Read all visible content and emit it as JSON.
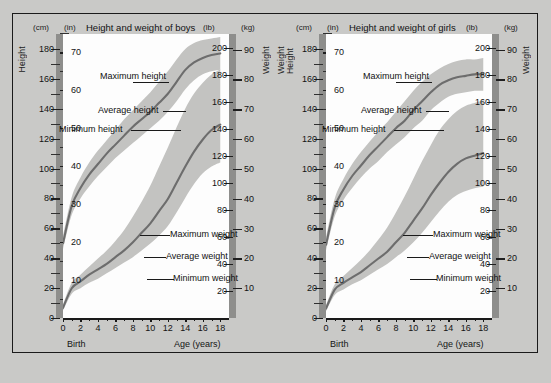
{
  "figure": {
    "background_color": "#c9c9c7",
    "plot_background_color": "#fdfdfd",
    "band_color": "#c3c3c1",
    "curve_color": "#6d6d6d",
    "scalebar_color": "#8e8e8c"
  },
  "panels": [
    {
      "id": "boys",
      "title": "Height and weight of boys",
      "left_outer_caption": "Height",
      "right_outer_caption": "Weight",
      "axes": {
        "left_outer": {
          "unit": "(cm)",
          "labels": [
            "180",
            "160",
            "140",
            "120",
            "100",
            "80",
            "60",
            "40",
            "20",
            "0"
          ]
        },
        "left_inner": {
          "unit": "(in)",
          "labels": [
            "70",
            "60",
            "50",
            "40",
            "30",
            "20",
            "10"
          ]
        },
        "right_inner": {
          "unit": "(lb)",
          "labels": [
            "200",
            "180",
            "160",
            "140",
            "120",
            "100",
            "80",
            "60",
            "40",
            "20"
          ]
        },
        "right_outer": {
          "unit": "(kg)",
          "labels": [
            "90",
            "80",
            "70",
            "60",
            "50",
            "40",
            "30",
            "20",
            "10"
          ]
        },
        "x": {
          "name": "Age (years)",
          "origin_label": "Birth",
          "labels": [
            "0",
            "2",
            "4",
            "6",
            "8",
            "10",
            "12",
            "14",
            "16",
            "18"
          ]
        }
      },
      "callouts": {
        "max_height": "Maximum\nheight",
        "avg_height": "Average height",
        "min_height": "Minimum height",
        "max_weight": "Maximum\nweight",
        "avg_weight": "Average\nweight",
        "min_weight": "Minimum\nweight"
      }
    },
    {
      "id": "girls",
      "title": "Height and weight of girls",
      "left_outer_caption": "Weight\nHeight",
      "right_outer_caption": "Weight",
      "axes": {
        "left_outer": {
          "unit": "(cm)",
          "labels": [
            "180",
            "160",
            "140",
            "120",
            "100",
            "80",
            "60",
            "40",
            "20",
            "0"
          ]
        },
        "left_inner": {
          "unit": "(in)",
          "labels": [
            "70",
            "60",
            "50",
            "40",
            "30",
            "20",
            "10"
          ]
        },
        "right_inner": {
          "unit": "(lb)",
          "labels": [
            "200",
            "180",
            "160",
            "140",
            "120",
            "100",
            "80",
            "60",
            "40",
            "20"
          ]
        },
        "right_outer": {
          "unit": "(kg)",
          "labels": [
            "90",
            "80",
            "70",
            "60",
            "50",
            "40",
            "30",
            "20",
            "10"
          ]
        },
        "x": {
          "name": "Age (years)",
          "origin_label": "Birth",
          "labels": [
            "0",
            "2",
            "4",
            "6",
            "8",
            "10",
            "12",
            "14",
            "16",
            "18"
          ]
        }
      },
      "callouts": {
        "max_height": "Maximum\nheight",
        "avg_height": "Average height",
        "min_height": "Minimum height",
        "max_weight": "Maximum\nweight",
        "avg_weight": "Average\nweight",
        "min_weight": "Minimum\nweight"
      }
    }
  ],
  "chart_data": [
    {
      "type": "line",
      "title": "Height and weight of boys",
      "xlabel": "Age (years)",
      "ylabel": "Height (cm) / Weight (lb)",
      "x": [
        0,
        1,
        2,
        3,
        4,
        5,
        6,
        7,
        8,
        9,
        10,
        11,
        12,
        13,
        14,
        15,
        16,
        17,
        18
      ],
      "xlim": [
        0,
        19
      ],
      "x_tick_labels": [
        "0",
        "2",
        "4",
        "6",
        "8",
        "10",
        "12",
        "14",
        "16",
        "18"
      ],
      "grid": false,
      "legend": "inline annotations",
      "axes_ranges": {
        "height_cm": [
          0,
          190
        ],
        "height_in": [
          0,
          75
        ],
        "weight_lb": [
          0,
          210
        ],
        "weight_kg": [
          0,
          95
        ]
      },
      "series": [
        {
          "name": "Average height",
          "units": "cm",
          "values": [
            50,
            75,
            87,
            96,
            103,
            110,
            116,
            122,
            128,
            133,
            138,
            144,
            150,
            158,
            166,
            171,
            174,
            176,
            177
          ]
        },
        {
          "name": "Maximum height",
          "units": "cm",
          "values": [
            55,
            81,
            94,
            104,
            112,
            119,
            126,
            133,
            139,
            145,
            151,
            158,
            165,
            173,
            180,
            184,
            186,
            187,
            188
          ]
        },
        {
          "name": "Minimum height",
          "units": "cm",
          "values": [
            46,
            69,
            80,
            88,
            95,
            101,
            107,
            112,
            117,
            122,
            127,
            132,
            138,
            145,
            153,
            159,
            163,
            165,
            166
          ]
        },
        {
          "name": "Average weight",
          "units": "lb",
          "values": [
            7.5,
            22,
            27,
            32,
            36,
            40,
            45,
            50,
            56,
            63,
            70,
            79,
            88,
            100,
            112,
            123,
            132,
            139,
            143
          ]
        },
        {
          "name": "Maximum weight",
          "units": "lb",
          "values": [
            10,
            26,
            32,
            38,
            44,
            50,
            57,
            65,
            75,
            86,
            98,
            112,
            126,
            141,
            155,
            166,
            174,
            180,
            184
          ]
        },
        {
          "name": "Minimum weight",
          "units": "lb",
          "values": [
            5.5,
            18,
            22,
            26,
            29,
            33,
            37,
            41,
            45,
            50,
            55,
            61,
            68,
            78,
            89,
            99,
            107,
            112,
            115
          ]
        }
      ]
    },
    {
      "type": "line",
      "title": "Height and weight of girls",
      "xlabel": "Age (years)",
      "ylabel": "Height (cm) / Weight (lb)",
      "x": [
        0,
        1,
        2,
        3,
        4,
        5,
        6,
        7,
        8,
        9,
        10,
        11,
        12,
        13,
        14,
        15,
        16,
        17,
        18
      ],
      "xlim": [
        0,
        19
      ],
      "x_tick_labels": [
        "0",
        "2",
        "4",
        "6",
        "8",
        "10",
        "12",
        "14",
        "16",
        "18"
      ],
      "grid": false,
      "legend": "inline annotations",
      "axes_ranges": {
        "height_cm": [
          0,
          190
        ],
        "height_in": [
          0,
          75
        ],
        "weight_lb": [
          0,
          210
        ],
        "weight_kg": [
          0,
          95
        ]
      },
      "series": [
        {
          "name": "Average height",
          "units": "cm",
          "values": [
            49,
            74,
            86,
            95,
            102,
            109,
            115,
            121,
            127,
            132,
            139,
            145,
            151,
            156,
            159,
            161,
            162,
            163,
            163
          ]
        },
        {
          "name": "Maximum height",
          "units": "cm",
          "values": [
            54,
            80,
            93,
            103,
            111,
            118,
            125,
            131,
            138,
            145,
            152,
            158,
            163,
            167,
            170,
            172,
            173,
            173,
            174
          ]
        },
        {
          "name": "Minimum height",
          "units": "cm",
          "values": [
            45,
            68,
            79,
            87,
            94,
            100,
            105,
            111,
            116,
            121,
            127,
            132,
            139,
            144,
            148,
            150,
            151,
            152,
            152
          ]
        },
        {
          "name": "Average weight",
          "units": "lb",
          "values": [
            7,
            21,
            26,
            30,
            34,
            39,
            44,
            49,
            56,
            63,
            72,
            81,
            91,
            100,
            108,
            114,
            118,
            120,
            122
          ]
        },
        {
          "name": "Maximum weight",
          "units": "lb",
          "values": [
            9.5,
            25,
            31,
            37,
            43,
            50,
            58,
            67,
            78,
            90,
            103,
            116,
            128,
            139,
            147,
            153,
            157,
            159,
            161
          ]
        },
        {
          "name": "Minimum weight",
          "units": "lb",
          "values": [
            5,
            17,
            21,
            25,
            28,
            32,
            36,
            40,
            45,
            50,
            56,
            63,
            71,
            79,
            86,
            91,
            94,
            96,
            97
          ]
        }
      ]
    }
  ]
}
